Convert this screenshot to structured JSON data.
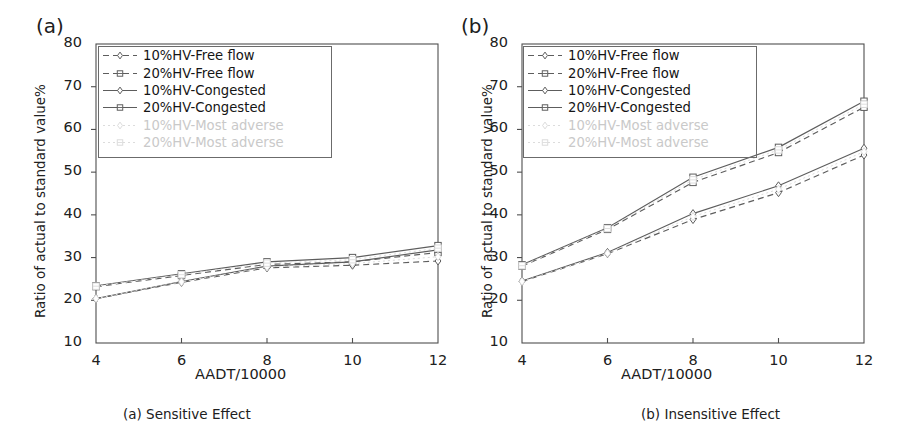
{
  "figure": {
    "width": 910,
    "height": 446,
    "background": "#ffffff",
    "ink_color": "#5d5d5d",
    "text_color": "#202020",
    "faint_color": "#dcdcdc"
  },
  "panels": [
    {
      "tag": "(a)",
      "caption": "(a) Sensitive Effect",
      "xlabel": "AADT/10000",
      "ylabel": "Ratio of actual to standard value%"
    },
    {
      "tag": "(b)",
      "caption": "(b) Insensitive Effect",
      "xlabel": "AADT/10000",
      "ylabel": "Ratio of actual to standard value%"
    }
  ],
  "legend": {
    "entries": [
      {
        "label": "10%HV-Free flow",
        "marker": "diamond",
        "line": "dashed",
        "visible": true
      },
      {
        "label": "20%HV-Free flow",
        "marker": "square",
        "line": "dashed",
        "visible": true
      },
      {
        "label": "10%HV-Congested",
        "marker": "diamond",
        "line": "solid",
        "visible": true
      },
      {
        "label": "20%HV-Congested",
        "marker": "square",
        "line": "solid",
        "visible": true
      },
      {
        "label": "10%HV-Most adverse",
        "marker": "diamond",
        "line": "dotted",
        "visible": false
      },
      {
        "label": "20%HV-Most adverse",
        "marker": "square",
        "line": "dotted",
        "visible": false
      }
    ]
  },
  "chart_data": [
    {
      "type": "line",
      "title": "(a) Sensitive Effect",
      "xlabel": "AADT/10000",
      "ylabel": "Ratio of actual to standard value%",
      "x": [
        4,
        6,
        8,
        10,
        12
      ],
      "xlim": [
        4,
        12
      ],
      "ylim": [
        10,
        80
      ],
      "xticks": [
        4,
        6,
        8,
        10,
        12
      ],
      "yticks": [
        10,
        20,
        30,
        40,
        50,
        60,
        70,
        80
      ],
      "grid": false,
      "legend_position": "top-left",
      "series": [
        {
          "name": "10%HV-Free flow",
          "values": [
            20.4,
            24.2,
            27.6,
            28.2,
            29.2
          ],
          "marker": "diamond",
          "line": "dashed"
        },
        {
          "name": "20%HV-Free flow",
          "values": [
            23.2,
            25.8,
            28.4,
            29.0,
            31.2
          ],
          "marker": "square",
          "line": "dashed"
        },
        {
          "name": "10%HV-Congested",
          "values": [
            20.4,
            24.4,
            28.0,
            29.0,
            31.8
          ],
          "marker": "diamond",
          "line": "solid"
        },
        {
          "name": "20%HV-Congested",
          "values": [
            23.4,
            26.2,
            29.0,
            30.0,
            32.8
          ],
          "marker": "square",
          "line": "solid"
        },
        {
          "name": "10%HV-Most adverse",
          "values": [
            20.4,
            24.3,
            27.8,
            28.6,
            30.2
          ],
          "marker": "diamond",
          "line": "dotted"
        },
        {
          "name": "20%HV-Most adverse",
          "values": [
            23.3,
            26.0,
            28.7,
            29.5,
            32.2
          ],
          "marker": "square",
          "line": "dotted"
        }
      ]
    },
    {
      "type": "line",
      "title": "(b) Insensitive Effect",
      "xlabel": "AADT/10000",
      "ylabel": "Ratio of actual to standard value%",
      "x": [
        4,
        6,
        8,
        10,
        12
      ],
      "xlim": [
        4,
        12
      ],
      "ylim": [
        10,
        80
      ],
      "xticks": [
        4,
        6,
        8,
        10,
        12
      ],
      "yticks": [
        10,
        20,
        30,
        40,
        50,
        60,
        70,
        80
      ],
      "grid": false,
      "legend_position": "top-left",
      "series": [
        {
          "name": "10%HV-Free flow",
          "values": [
            24.4,
            30.9,
            38.9,
            45.2,
            54.0
          ],
          "marker": "diamond",
          "line": "dashed"
        },
        {
          "name": "20%HV-Free flow",
          "values": [
            28.0,
            36.6,
            47.6,
            54.6,
            65.2
          ],
          "marker": "square",
          "line": "dashed"
        },
        {
          "name": "10%HV-Congested",
          "values": [
            24.5,
            31.2,
            40.3,
            46.8,
            55.6
          ],
          "marker": "diamond",
          "line": "solid"
        },
        {
          "name": "20%HV-Congested",
          "values": [
            28.3,
            37.0,
            48.8,
            55.8,
            66.6
          ],
          "marker": "square",
          "line": "solid"
        },
        {
          "name": "10%HV-Most adverse",
          "values": [
            24.4,
            31.0,
            39.6,
            46.0,
            54.8
          ],
          "marker": "diamond",
          "line": "dotted"
        },
        {
          "name": "20%HV-Most adverse",
          "values": [
            28.1,
            36.8,
            48.2,
            55.2,
            65.9
          ],
          "marker": "square",
          "line": "dotted"
        }
      ]
    }
  ]
}
